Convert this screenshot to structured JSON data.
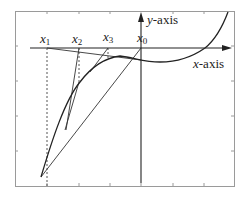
{
  "diagram": {
    "colors": {
      "background": "#ffffff",
      "frame": "#9a9a9a",
      "axis": "#222222",
      "curve": "#222222",
      "tangent": "#333333",
      "dashed": "#555555"
    },
    "axes": {
      "x_label_var": "x",
      "x_label_suffix": "-axis",
      "y_label_var": "y",
      "y_label_suffix": "-axis"
    },
    "points": [
      {
        "var": "x",
        "sub": "1"
      },
      {
        "var": "x",
        "sub": "2"
      },
      {
        "var": "x",
        "sub": "3"
      },
      {
        "var": "x",
        "sub": "0"
      }
    ]
  }
}
